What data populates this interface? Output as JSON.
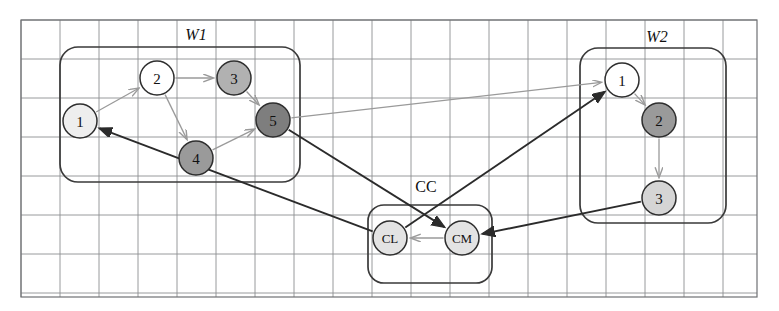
{
  "canvas": {
    "width": 779,
    "height": 311,
    "background": "#ffffff"
  },
  "grid": {
    "x0": 21,
    "y0": 20,
    "x1": 757,
    "y1": 297,
    "cell_width": 39,
    "cell_height": 39,
    "line_color": "#8d8f91"
  },
  "groups": [
    {
      "id": "W1",
      "label": "W1",
      "label_x": 196,
      "label_y": 36,
      "box": {
        "x": 60,
        "y": 47,
        "width": 240,
        "height": 135,
        "radius": 18
      }
    },
    {
      "id": "CC",
      "label": "CC",
      "label_x": 426,
      "label_y": 188,
      "box": {
        "x": 368,
        "y": 205,
        "width": 124,
        "height": 78,
        "radius": 16
      }
    },
    {
      "id": "W2",
      "label": "W2",
      "label_x": 657,
      "label_y": 38,
      "box": {
        "x": 580,
        "y": 48,
        "width": 146,
        "height": 175,
        "radius": 18
      }
    }
  ],
  "nodes": [
    {
      "id": "w1n1",
      "group": "W1",
      "label": "1",
      "cx": 80,
      "cy": 121,
      "r": 17,
      "fill": "#eeeeee"
    },
    {
      "id": "w1n2",
      "group": "W1",
      "label": "2",
      "cx": 157,
      "cy": 78,
      "r": 17,
      "fill": "#ffffff"
    },
    {
      "id": "w1n3",
      "group": "W1",
      "label": "3",
      "cx": 234,
      "cy": 78,
      "r": 17,
      "fill": "#b1b1b1"
    },
    {
      "id": "w1n4",
      "group": "W1",
      "label": "4",
      "cx": 196,
      "cy": 158,
      "r": 17,
      "fill": "#9a9a9a"
    },
    {
      "id": "w1n5",
      "group": "W1",
      "label": "5",
      "cx": 273,
      "cy": 120,
      "r": 17,
      "fill": "#7e7e7e"
    },
    {
      "id": "ccCL",
      "group": "CC",
      "label": "CL",
      "cx": 390,
      "cy": 238,
      "r": 17,
      "fill": "#e3e3e3"
    },
    {
      "id": "ccCM",
      "group": "CC",
      "label": "CM",
      "cx": 462,
      "cy": 238,
      "r": 17,
      "fill": "#e3e3e3"
    },
    {
      "id": "w2n1",
      "group": "W2",
      "label": "1",
      "cx": 622,
      "cy": 80,
      "r": 17,
      "fill": "#ffffff"
    },
    {
      "id": "w2n2",
      "group": "W2",
      "label": "2",
      "cx": 659,
      "cy": 120,
      "r": 17,
      "fill": "#9a9a9a"
    },
    {
      "id": "w2n3",
      "group": "W2",
      "label": "3",
      "cx": 659,
      "cy": 198,
      "r": 17,
      "fill": "#d5d5d5"
    }
  ],
  "edges": [
    {
      "id": "e-w1-1-2",
      "from": "w1n1",
      "to": "w1n2",
      "style": "internal"
    },
    {
      "id": "e-w1-2-3",
      "from": "w1n2",
      "to": "w1n3",
      "style": "internal"
    },
    {
      "id": "e-w1-2-4",
      "from": "w1n2",
      "to": "w1n4",
      "style": "internal"
    },
    {
      "id": "e-w1-3-5",
      "from": "w1n3",
      "to": "w1n5",
      "style": "internal"
    },
    {
      "id": "e-w1-4-5",
      "from": "w1n4",
      "to": "w1n5",
      "style": "internal"
    },
    {
      "id": "e-w2-1-2",
      "from": "w2n1",
      "to": "w2n2",
      "style": "internal"
    },
    {
      "id": "e-w2-2-3",
      "from": "w2n2",
      "to": "w2n3",
      "style": "internal"
    },
    {
      "id": "e-cm-cl",
      "from": "ccCM",
      "to": "ccCL",
      "style": "internal"
    },
    {
      "id": "e-w1n5-w2n1",
      "from": "w1n5",
      "to": "w2n1",
      "style": "cross-light"
    },
    {
      "id": "e-w1n5-ccCM",
      "from": "w1n5",
      "to": "ccCM",
      "style": "cross-dark"
    },
    {
      "id": "e-ccCL-w2n1",
      "from": "ccCL",
      "to": "w2n1",
      "style": "cross-dark"
    },
    {
      "id": "e-ccCL-w1n1",
      "from": "ccCL",
      "to": "w1n1",
      "style": "cross-dark"
    },
    {
      "id": "e-w2n3-ccCM",
      "from": "w2n3",
      "to": "ccCM",
      "style": "cross-dark"
    }
  ],
  "colors": {
    "grid": "#8d8f91",
    "group_stroke": "#3a3a3a",
    "node_stroke": "#2e2e2e",
    "edge_light": "#9a9a9a",
    "edge_dark": "#2b2b2b",
    "text": "#111111"
  }
}
